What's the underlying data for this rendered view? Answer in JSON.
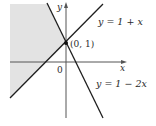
{
  "figure": {
    "type": "region-graph",
    "axes": {
      "x_label": "x",
      "y_label": "y",
      "origin_label": "0"
    },
    "lines": [
      {
        "id": "line1",
        "equation": "y = 1 + x",
        "label": "y = 1 + x"
      },
      {
        "id": "line2",
        "equation": "y = 1 − 2x",
        "label": "y = 1 − 2x"
      }
    ],
    "intersection": {
      "label": "(0, 1)",
      "x": 0,
      "y": 1
    },
    "shaded_region": {
      "description": "Region to the left of y = 1 - 2x and above y = 1 + x",
      "fill": "#e3e3e3"
    },
    "colors": {
      "line": "#1e1e1e",
      "axis": "#555555",
      "shade": "#e3e3e3",
      "text": "#2a2a2a"
    }
  }
}
